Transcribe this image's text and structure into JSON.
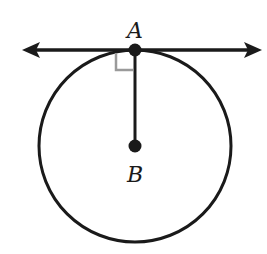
{
  "diagram": {
    "points": [
      {
        "id": "A",
        "label": "A",
        "x": 135,
        "y": 50,
        "role": "point of tangency"
      },
      {
        "id": "B",
        "label": "B",
        "x": 135,
        "y": 146,
        "role": "center of circle"
      }
    ],
    "circle": {
      "cx": 135,
      "cy": 146,
      "r": 96
    },
    "tangent_line": {
      "x1": 22,
      "y1": 50,
      "x2": 262,
      "y2": 50,
      "arrows": "both"
    },
    "radius_segment": {
      "from": "A",
      "to": "B"
    },
    "right_angle_marker": {
      "at": "A",
      "color": "#9a9a9a"
    },
    "colors": {
      "stroke": "#1a1a1a",
      "marker": "#9a9a9a",
      "background": "#ffffff"
    }
  }
}
